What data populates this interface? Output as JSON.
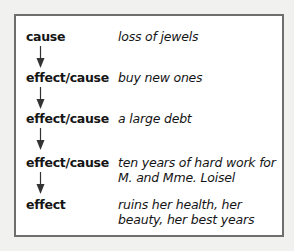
{
  "header_fragment": "",
  "diagram": {
    "rows": [
      {
        "term": "cause",
        "description": "loss of jewels"
      },
      {
        "term": "effect/cause",
        "description": "buy new ones"
      },
      {
        "term": "effect/cause",
        "description": "a large debt"
      },
      {
        "term": "effect/cause",
        "description": "ten years of hard work for M. and Mme. Loisel"
      },
      {
        "term": "effect",
        "description": "ruins her health, her beauty, her best years"
      }
    ]
  },
  "colors": {
    "border": "#6e6e6e",
    "text": "#151515",
    "background": "#f1f1ef"
  }
}
